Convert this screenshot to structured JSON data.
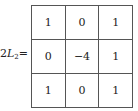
{
  "label": {
    "prefix": "2",
    "var": "L",
    "sub": "2",
    "suffix": "="
  },
  "kernel": {
    "rows": [
      [
        "1",
        "0",
        "1"
      ],
      [
        "0",
        "-4",
        "1"
      ],
      [
        "1",
        "0",
        "1"
      ]
    ]
  }
}
